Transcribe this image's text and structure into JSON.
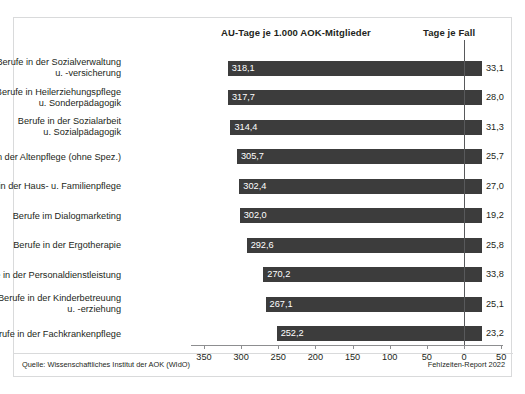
{
  "headers": {
    "left_column": "AU-Tage je 1.000 AOK-Mitglieder",
    "right_column": "Tage je Fall"
  },
  "footer": {
    "source": "Quelle: Wissenschaftliches Institut der AOK (WIdO)",
    "report": "Fehlzeiten-Report 2022"
  },
  "colors": {
    "bar": "#3c3c3c",
    "bar_label": "#ffffff",
    "text": "#231f20",
    "frame": "#d9dadb",
    "axis": "#8d8e90",
    "zero_line": "#58595b"
  },
  "chart_data": {
    "type": "bar",
    "orientation": "horizontal",
    "title": "AU-Tage je 1.000 AOK-Mitglieder",
    "xlabel": "",
    "ylabel": "",
    "xlim": [
      350,
      -50
    ],
    "x_ticks": [
      350,
      300,
      250,
      200,
      150,
      100,
      50,
      0,
      50
    ],
    "x_tick_labels": [
      "350",
      "300",
      "250",
      "200",
      "150",
      "100",
      "50",
      "0",
      "50"
    ],
    "grid": false,
    "legend": "none",
    "axis_note": "Axis runs right-to-left from 350 to 0, then continues 0 to 50 to the right of the zero line; bars span from their AU-Tage value across the zero line to a fixed right edge.",
    "categories": [
      "Berufe in der Sozialverwaltung\nu. -versicherung",
      "Berufe in Heilerziehungspflege\nu. Sonderpädagogik",
      "Berufe in der Sozialarbeit\nu. Sozialpädagogik",
      "Berufe in der Altenpflege (ohne Spez.)",
      "Berufe in der Haus- u. Familienpflege",
      "Berufe im Dialogmarketing",
      "Berufe in der Ergotherapie",
      "Berufe in der Personaldienstleistung",
      "Berufe in der Kinderbetreuung\nu. -erziehung",
      "Berufe in der Fachkrankenpflege"
    ],
    "series": [
      {
        "name": "AU-Tage je 1.000 AOK-Mitglieder",
        "values": [
          318.1,
          317.7,
          314.4,
          305.7,
          302.4,
          302.0,
          292.6,
          270.2,
          267.1,
          252.2
        ],
        "labels": [
          "318,1",
          "317,7",
          "314,4",
          "305,7",
          "302,4",
          "302,0",
          "292,6",
          "270,2",
          "267,1",
          "252,2"
        ]
      },
      {
        "name": "Tage je Fall",
        "values": [
          33.1,
          28.0,
          31.3,
          25.7,
          27.0,
          19.2,
          25.8,
          33.8,
          25.1,
          23.2
        ],
        "labels": [
          "33,1",
          "28,0",
          "31,3",
          "25,7",
          "27,0",
          "19,2",
          "25,8",
          "33,8",
          "25,1",
          "23,2"
        ]
      }
    ]
  }
}
